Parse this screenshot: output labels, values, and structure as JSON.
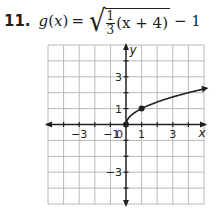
{
  "problem": {
    "number": "11.",
    "func_name": "g",
    "var": "x",
    "equals": "=",
    "frac_num": "1",
    "frac_den": "3",
    "radicand_rest": "(x + 4)",
    "after_radical": "− 1",
    "lparen": "(",
    "rparen": ")"
  },
  "chart_data": {
    "type": "line",
    "xlabel": "x",
    "ylabel": "y",
    "xlim": [
      -5,
      5
    ],
    "ylim": [
      -5,
      5
    ],
    "grid": true,
    "x_tick_labels": [
      "−3",
      "−1",
      "0",
      "1",
      "3"
    ],
    "y_tick_labels": [
      "3",
      "1",
      "−3"
    ],
    "series": [
      {
        "name": "curve",
        "x": [
          0,
          0.25,
          0.5,
          1,
          2,
          3,
          4,
          5
        ],
        "y": [
          0,
          0.5,
          0.71,
          1,
          1.41,
          1.73,
          2,
          2.24
        ],
        "endpoint_arrow": "right"
      }
    ],
    "points": [
      {
        "x": 0,
        "y": 0
      },
      {
        "x": 1,
        "y": 1
      }
    ],
    "colors": {
      "line": "#231f20",
      "grid": "#b8b8b8"
    }
  }
}
